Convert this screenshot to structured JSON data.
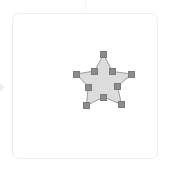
{
  "app": {
    "view_name": "artboard-canvas",
    "background_color": "#ffffff"
  },
  "canvas": {
    "label": "",
    "x": 12,
    "y": 13,
    "width": 146,
    "height": 146,
    "border_color": "#ededed",
    "fill_color": "#ffffff",
    "corner_radius": 7
  },
  "decorations": {
    "top_tick": {
      "icon": "tick-mark-icon",
      "color": "#f0f0f0"
    },
    "left_caret": {
      "icon": "caret-left-icon",
      "color": "#eeeeee"
    }
  },
  "selection": {
    "shape_name": "star-shape",
    "shape_type": "star",
    "points": 5,
    "fill_color": "#dcdcdc",
    "stroke_color": "#9e9e9e",
    "stroke_width": 1,
    "handle_color": "#8c8c8c",
    "handle_border_color": "#7a7a7a",
    "handle_size": 7,
    "selected": true,
    "outline_path": "M 103.5,54.5 L 112.5,71.5 L 131.5,74.0 L 117.5,86.5 L 121.5,104.5 L 103.5,97.0 L 86.5,105.5 L 88.0,87.0 L 76.5,74.0 L 94.5,71.0 Z",
    "handles": [
      {
        "name": "handle-tip-top",
        "x": 103.5,
        "y": 54.5,
        "kind": "outer-point"
      },
      {
        "name": "handle-inner-upper-right",
        "x": 112.5,
        "y": 71.5,
        "kind": "inner-point"
      },
      {
        "name": "handle-tip-right",
        "x": 131.5,
        "y": 74.0,
        "kind": "outer-point"
      },
      {
        "name": "handle-inner-right",
        "x": 117.5,
        "y": 86.5,
        "kind": "inner-point"
      },
      {
        "name": "handle-tip-bottom-right",
        "x": 121.5,
        "y": 104.5,
        "kind": "outer-point"
      },
      {
        "name": "handle-inner-bottom",
        "x": 103.5,
        "y": 97.0,
        "kind": "inner-point"
      },
      {
        "name": "handle-tip-bottom-left",
        "x": 86.5,
        "y": 105.5,
        "kind": "outer-point"
      },
      {
        "name": "handle-inner-left",
        "x": 88.0,
        "y": 87.0,
        "kind": "inner-point"
      },
      {
        "name": "handle-tip-left",
        "x": 76.5,
        "y": 74.0,
        "kind": "outer-point"
      },
      {
        "name": "handle-inner-upper-left",
        "x": 94.5,
        "y": 71.0,
        "kind": "inner-point"
      }
    ]
  }
}
